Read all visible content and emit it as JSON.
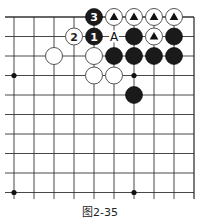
{
  "figure": {
    "caption": "图2-35"
  },
  "board": {
    "columns": 10,
    "rows": 10,
    "origin_x": 14,
    "origin_y": 17,
    "spacing_x": 20,
    "spacing_y": 19.5,
    "edges": {
      "top": true,
      "right": true,
      "left": false,
      "bottom": false
    },
    "colors": {
      "line": "#333333",
      "black": "#1a1a1a",
      "white": "#ffffff",
      "star": "#111111"
    },
    "star_points": [
      [
        0,
        3
      ],
      [
        6,
        3
      ],
      [
        0,
        9
      ],
      [
        6,
        9
      ]
    ],
    "stones": [
      {
        "col": 4,
        "row": 0,
        "color": "black",
        "label": "3"
      },
      {
        "col": 5,
        "row": 0,
        "color": "white",
        "mark": "triangle"
      },
      {
        "col": 6,
        "row": 0,
        "color": "white",
        "mark": "triangle"
      },
      {
        "col": 7,
        "row": 0,
        "color": "white",
        "mark": "triangle"
      },
      {
        "col": 8,
        "row": 0,
        "color": "white",
        "mark": "triangle"
      },
      {
        "col": 3,
        "row": 1,
        "color": "white",
        "label": "2"
      },
      {
        "col": 4,
        "row": 1,
        "color": "black",
        "label": "1"
      },
      {
        "col": 6,
        "row": 1,
        "color": "black"
      },
      {
        "col": 7,
        "row": 1,
        "color": "white",
        "mark": "triangle"
      },
      {
        "col": 8,
        "row": 1,
        "color": "black"
      },
      {
        "col": 2,
        "row": 2,
        "color": "white"
      },
      {
        "col": 4,
        "row": 2,
        "color": "white"
      },
      {
        "col": 5,
        "row": 2,
        "color": "black"
      },
      {
        "col": 6,
        "row": 2,
        "color": "black"
      },
      {
        "col": 7,
        "row": 2,
        "color": "black"
      },
      {
        "col": 8,
        "row": 2,
        "color": "black"
      },
      {
        "col": 4,
        "row": 3,
        "color": "white"
      },
      {
        "col": 5,
        "row": 3,
        "color": "white"
      },
      {
        "col": 6,
        "row": 4,
        "color": "black"
      }
    ],
    "point_labels": [
      {
        "col": 5,
        "row": 1,
        "text": "A"
      }
    ]
  }
}
